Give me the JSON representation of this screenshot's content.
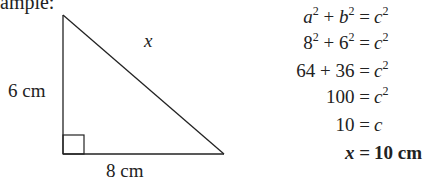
{
  "heading": "ample:",
  "triangle": {
    "hypotenuse_label": "x",
    "vertical_label": "6 cm",
    "horizontal_label": "8 cm"
  },
  "equations": [
    {
      "lhs": [
        {
          "t": "a",
          "i": true
        },
        {
          "sup": "2"
        },
        {
          "t": " + "
        },
        {
          "t": "b",
          "i": true
        },
        {
          "sup": "2"
        }
      ],
      "rhs": [
        {
          "t": "c",
          "i": true
        },
        {
          "sup": "2"
        }
      ]
    },
    {
      "lhs": [
        {
          "t": "8"
        },
        {
          "sup": "2"
        },
        {
          "t": " + 6"
        },
        {
          "sup": "2"
        }
      ],
      "rhs": [
        {
          "t": "c",
          "i": true
        },
        {
          "sup": "2"
        }
      ]
    },
    {
      "lhs": [
        {
          "t": "64 + 36"
        }
      ],
      "rhs": [
        {
          "t": " c",
          "i": true
        },
        {
          "sup": "2"
        }
      ]
    },
    {
      "lhs": [
        {
          "t": "100"
        }
      ],
      "rhs": [
        {
          "t": " c",
          "i": true
        },
        {
          "sup": "2"
        }
      ]
    },
    {
      "lhs": [
        {
          "t": "10"
        }
      ],
      "rhs": [
        {
          "t": " c",
          "i": true
        }
      ]
    },
    {
      "lhs": [
        {
          "t": "x",
          "i": true,
          "b": true
        }
      ],
      "rhs": [
        {
          "t": "10 cm",
          "b": true
        }
      ],
      "bold": true
    }
  ],
  "equation_text": [
    "a^2 + b^2 = c^2",
    "8^2 + 6^2 = c^2",
    "64 + 36 = c^2",
    "100 = c^2",
    "10 = c",
    "x = 10 cm"
  ],
  "equals_sign": "="
}
